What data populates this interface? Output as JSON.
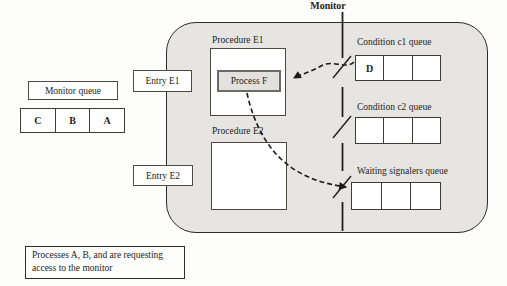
{
  "title": "Monitor",
  "outside": {
    "monitor_queue": {
      "label": "Monitor queue",
      "cells": [
        "C",
        "B",
        "A"
      ]
    },
    "entry_e1_label": "Entry E1",
    "entry_e2_label": "Entry E2",
    "caption_line1": "Processes A, B, and are requesting",
    "caption_line2": "access to the monitor"
  },
  "procedures": {
    "e1": {
      "label": "Procedure E1",
      "process_label": "Process F"
    },
    "e2": {
      "label": "Procedure E2"
    }
  },
  "queues": {
    "c1": {
      "label": "Condition c1 queue",
      "cells": [
        "D",
        "",
        ""
      ]
    },
    "c2": {
      "label": "Condition c2 queue",
      "cells": [
        "",
        "",
        ""
      ]
    },
    "waiting": {
      "label": "Waiting signalers queue",
      "cells": [
        "",
        "",
        ""
      ]
    }
  },
  "colors": {
    "monitor_fill": "#e6e5e2",
    "outline": "#2b2b28",
    "box_border": "#4a4a45",
    "process_fill": "#e2e1de",
    "arrow": "#1a1a17",
    "background": "#fdfdfc"
  }
}
